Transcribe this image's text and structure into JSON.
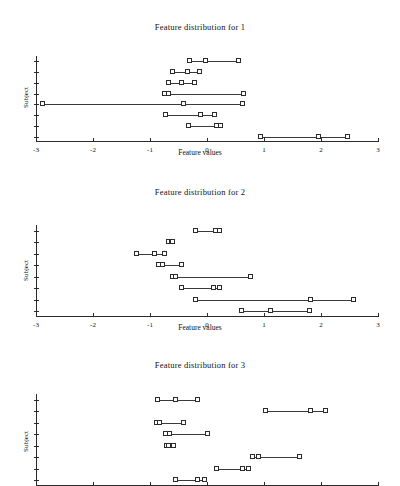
{
  "figure": {
    "xlabel": "Feature values",
    "ylabel": "Subject",
    "xlim": [
      -3,
      3
    ],
    "xticks": [
      -3,
      -2,
      -1,
      0,
      1,
      2,
      3
    ],
    "xticklabels": [
      "-3",
      "-2",
      "-1",
      "0",
      "1",
      "2",
      "3"
    ],
    "n_subjects": 8,
    "marker": "square",
    "marker_face_color": "#ffffff",
    "line_color": "#3a3a3a",
    "axis_color": "#2a2a2a"
  },
  "chart_data": [
    {
      "type": "line",
      "title": "Feature distribution for 1",
      "xlabel": "Feature values",
      "ylabel": "Subject",
      "xlim": [
        -3,
        3
      ],
      "xticks": [
        -3,
        -2,
        -1,
        0,
        1,
        2,
        3
      ],
      "grid": false,
      "legend": "none",
      "series": [
        {
          "name": "Subject 8",
          "values": [
            -0.3,
            -0.02,
            0.57
          ]
        },
        {
          "name": "Subject 7",
          "values": [
            -0.59,
            -0.33,
            -0.13
          ]
        },
        {
          "name": "Subject 6",
          "values": [
            -0.66,
            -0.44,
            -0.21
          ]
        },
        {
          "name": "Subject 5",
          "values": [
            -0.74,
            -0.67,
            0.65
          ]
        },
        {
          "name": "Subject 4",
          "values": [
            -2.88,
            -0.4,
            0.63
          ]
        },
        {
          "name": "Subject 3",
          "values": [
            -0.72,
            -0.1,
            0.14
          ]
        },
        {
          "name": "Subject 2",
          "values": [
            -0.31,
            0.17,
            0.25
          ]
        },
        {
          "name": "Subject 1",
          "values": [
            0.95,
            1.97,
            2.48
          ]
        }
      ]
    },
    {
      "type": "line",
      "title": "Feature distribution for 2",
      "xlabel": "Feature values",
      "ylabel": "Subject",
      "xlim": [
        -3,
        3
      ],
      "xticks": [
        -3,
        -2,
        -1,
        0,
        1,
        2,
        3
      ],
      "grid": false,
      "legend": "none",
      "series": [
        {
          "name": "Subject 8",
          "values": [
            -0.19,
            0.15,
            0.23
          ]
        },
        {
          "name": "Subject 7",
          "values": [
            -0.66,
            -0.62,
            -0.6
          ]
        },
        {
          "name": "Subject 6",
          "values": [
            -1.23,
            -0.91,
            -0.74
          ]
        },
        {
          "name": "Subject 5",
          "values": [
            -0.85,
            -0.78,
            -0.44
          ]
        },
        {
          "name": "Subject 4",
          "values": [
            -0.6,
            -0.55,
            0.78
          ]
        },
        {
          "name": "Subject 3",
          "values": [
            -0.43,
            0.13,
            0.22
          ]
        },
        {
          "name": "Subject 2",
          "values": [
            -0.19,
            1.83,
            2.58
          ]
        },
        {
          "name": "Subject 1",
          "values": [
            0.61,
            1.13,
            1.8
          ]
        }
      ]
    },
    {
      "type": "line",
      "title": "Feature distribution for 3",
      "xlabel": "Feature values",
      "ylabel": "Subject",
      "xlim": [
        -3,
        3
      ],
      "xticks": [
        -3,
        -2,
        -1,
        0,
        1,
        2,
        3
      ],
      "grid": false,
      "legend": "none",
      "series": [
        {
          "name": "Subject 8",
          "values": [
            -0.86,
            -0.55,
            -0.15
          ]
        },
        {
          "name": "Subject 7",
          "values": [
            1.03,
            1.83,
            2.08
          ]
        },
        {
          "name": "Subject 6",
          "values": [
            -0.88,
            -0.83,
            -0.4
          ]
        },
        {
          "name": "Subject 5",
          "values": [
            -0.72,
            -0.65,
            0.02
          ]
        },
        {
          "name": "Subject 4",
          "values": [
            -0.7,
            -0.66,
            -0.58
          ]
        },
        {
          "name": "Subject 3",
          "values": [
            0.8,
            0.92,
            1.64
          ]
        },
        {
          "name": "Subject 2",
          "values": [
            0.18,
            0.64,
            0.73
          ]
        },
        {
          "name": "Subject 1",
          "values": [
            -0.55,
            -0.16,
            -0.04
          ]
        }
      ]
    }
  ]
}
